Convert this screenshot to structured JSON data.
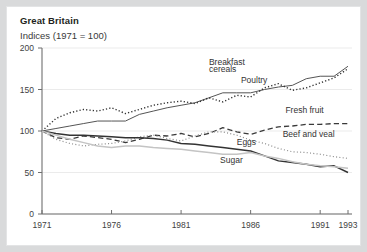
{
  "chart_data": {
    "type": "line",
    "title": "Great Britain",
    "subtitle": "Indices (1971 = 100)",
    "xlabel": "",
    "ylabel": "",
    "xlim": [
      1971,
      1993
    ],
    "ylim": [
      0,
      200
    ],
    "grid": true,
    "legend_position": "inline-annotations",
    "yticks": [
      "0",
      "50",
      "100",
      "150",
      "200"
    ],
    "ytick_values": [
      0,
      50,
      100,
      150,
      200
    ],
    "xticks": [
      "1971",
      "1976",
      "1981",
      "1986",
      "1991",
      "1993"
    ],
    "xtick_values": [
      1971,
      1976,
      1981,
      1986,
      1991,
      1993
    ],
    "x": [
      1971,
      1972,
      1973,
      1974,
      1975,
      1976,
      1977,
      1978,
      1979,
      1980,
      1981,
      1982,
      1983,
      1984,
      1985,
      1986,
      1987,
      1988,
      1989,
      1990,
      1991,
      1992,
      1993
    ],
    "series": [
      {
        "name": "Breakfast cereals",
        "style": "solid",
        "color": "#555555",
        "width": 1.0,
        "label_x": 1983.0,
        "label_y": 176,
        "values": [
          100,
          103,
          106,
          109,
          112,
          112,
          112,
          120,
          124,
          128,
          131,
          134,
          140,
          146,
          146,
          146,
          150,
          153,
          155,
          163,
          166,
          166,
          178
        ]
      },
      {
        "name": "Poultry",
        "style": "dotted",
        "color": "#333333",
        "width": 1.4,
        "label_x": 1985.3,
        "label_y": 160,
        "values": [
          100,
          115,
          122,
          126,
          124,
          128,
          121,
          126,
          131,
          134,
          136,
          133,
          140,
          135,
          143,
          141,
          152,
          157,
          149,
          152,
          158,
          164,
          175
        ]
      },
      {
        "name": "Fresh fruit",
        "style": "dashed",
        "color": "#3a3a3a",
        "width": 1.3,
        "label_x": 1988.5,
        "label_y": 120,
        "values": [
          100,
          92,
          90,
          94,
          92,
          90,
          86,
          90,
          95,
          94,
          97,
          93,
          97,
          104,
          99,
          96,
          101,
          105,
          106,
          108,
          108,
          109,
          109
        ]
      },
      {
        "name": "Beef and veal",
        "style": "fine-dotted",
        "color": "#8a8a8a",
        "width": 1.2,
        "label_x": 1988.3,
        "label_y": 92,
        "values": [
          100,
          90,
          85,
          82,
          84,
          85,
          88,
          93,
          95,
          91,
          88,
          94,
          99,
          99,
          95,
          89,
          85,
          79,
          75,
          74,
          72,
          69,
          67
        ]
      },
      {
        "name": "Eggs",
        "style": "solid",
        "color": "#333333",
        "width": 1.5,
        "label_x": 1985.0,
        "label_y": 82,
        "values": [
          100,
          97,
          95,
          95,
          94,
          93,
          92,
          92,
          91,
          89,
          85,
          84,
          82,
          80,
          78,
          76,
          70,
          64,
          62,
          60,
          57,
          58,
          50
        ]
      },
      {
        "name": "Sugar",
        "style": "solid",
        "color": "#c4c4c4",
        "width": 1.5,
        "label_x": 1983.8,
        "label_y": 60,
        "values": [
          100,
          95,
          90,
          86,
          82,
          80,
          82,
          82,
          80,
          79,
          78,
          76,
          74,
          72,
          72,
          74,
          70,
          67,
          63,
          60,
          58,
          57,
          55
        ]
      }
    ],
    "annotations": [
      {
        "text": "Breakfast",
        "x": 1983.0,
        "y": 180
      },
      {
        "text": "cereals",
        "x": 1983.0,
        "y": 171
      },
      {
        "text": "Poultry",
        "x": 1985.3,
        "y": 158
      },
      {
        "text": "Fresh fruit",
        "x": 1988.5,
        "y": 122
      },
      {
        "text": "Beef and veal",
        "x": 1988.3,
        "y": 93
      },
      {
        "text": "Eggs",
        "x": 1985.0,
        "y": 83
      },
      {
        "text": "Sugar",
        "x": 1983.8,
        "y": 61
      }
    ]
  }
}
